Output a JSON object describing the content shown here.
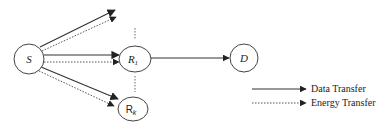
{
  "diagram": {
    "nodes": [
      {
        "id": "S",
        "label": "S",
        "cx": 29,
        "cy": 59,
        "rx": 15,
        "ry": 15
      },
      {
        "id": "R1",
        "label": "R",
        "subscript": "1",
        "cx": 135,
        "cy": 59,
        "rx": 16,
        "ry": 13
      },
      {
        "id": "Rk",
        "label": "R",
        "subscript": "k",
        "cx": 133,
        "cy": 109,
        "rx": 15,
        "ry": 12
      },
      {
        "id": "D",
        "label": "D",
        "cx": 244,
        "cy": 58,
        "rx": 14,
        "ry": 14
      }
    ],
    "edges": [
      {
        "from": "S",
        "to": "top",
        "type": "data"
      },
      {
        "from": "S",
        "to": "top",
        "type": "energy"
      },
      {
        "from": "S",
        "to": "R1",
        "type": "data"
      },
      {
        "from": "S",
        "to": "R1",
        "type": "energy"
      },
      {
        "from": "S",
        "to": "Rk",
        "type": "data"
      },
      {
        "from": "S",
        "to": "Rk",
        "type": "energy"
      },
      {
        "from": "R1",
        "to": "D",
        "type": "data"
      }
    ],
    "legend": {
      "data_transfer": "Data Transfer",
      "energy_transfer": "Energy Transfer"
    },
    "colors": {
      "stroke": "#333333",
      "background": "#ffffff"
    }
  }
}
